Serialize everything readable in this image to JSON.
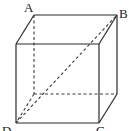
{
  "figure": {
    "type": "cube",
    "labels": {
      "A": "A",
      "B": "B",
      "C": "C",
      "D": "D"
    },
    "colors": {
      "stroke": "#2a2a2a",
      "background": "#ffffff"
    }
  }
}
